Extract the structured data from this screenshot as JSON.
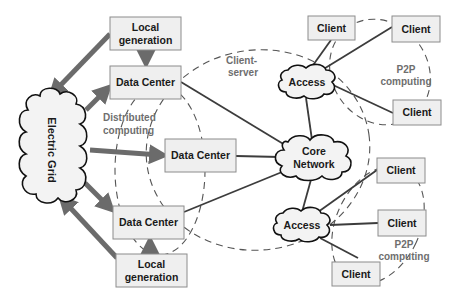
{
  "diagram": {
    "electric_grid": {
      "label": "Electric Grid"
    },
    "local_generation_top": {
      "line1": "Local",
      "line2": "generation"
    },
    "local_generation_bottom": {
      "line1": "Local",
      "line2": "generation"
    },
    "data_centers": [
      {
        "label": "Data Center"
      },
      {
        "label": "Data Center"
      },
      {
        "label": "Data Center"
      }
    ],
    "core_network": {
      "line1": "Core",
      "line2": "Network"
    },
    "access_top": {
      "label": "Access"
    },
    "access_bottom": {
      "label": "Access"
    },
    "clients": [
      {
        "label": "Client"
      },
      {
        "label": "Client"
      },
      {
        "label": "Client"
      },
      {
        "label": "Client"
      },
      {
        "label": "Client"
      },
      {
        "label": "Client"
      }
    ],
    "annotations": {
      "distributed": {
        "line1": "Distributed",
        "line2": "computing"
      },
      "client_server": {
        "line1": "Client-",
        "line2": "server"
      },
      "p2p_top": {
        "line1": "P2P",
        "line2": "computing"
      },
      "p2p_bottom": {
        "line1": "P2P",
        "line2": "computing"
      }
    },
    "colors": {
      "box_fill": "#efefef",
      "power_arrow": "#6b6b6b",
      "link": "#3c3c3c",
      "annotation_text": "#6e6e6e"
    }
  }
}
